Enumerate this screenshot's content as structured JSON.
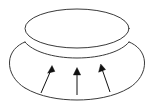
{
  "figure": {
    "kind": "line-diagram",
    "title": "",
    "background_color": "#ffffff",
    "outline_color": "#3a3a3a",
    "arrow_color": "#111111",
    "canvas": {
      "width": 154,
      "height": 103
    },
    "shapes": {
      "dome": {
        "name": "upper-ellipse-dome",
        "center_x": 77,
        "center_y": 28.5,
        "radius_x": 52,
        "radius_y": 19.5
      },
      "skirt_outer": {
        "name": "lower-ellipse-skirt",
        "center_x": 77,
        "center_y": 78,
        "radius_x": 68,
        "radius_y": 20
      },
      "junction_left": {
        "x": 25,
        "y": 42
      },
      "junction_right": {
        "x": 129,
        "y": 42
      }
    },
    "arrows": [
      {
        "name": "arrow-left",
        "label": "",
        "tail": {
          "x": 41,
          "y": 93
        },
        "tip": {
          "x": 52,
          "y": 66
        },
        "direction": "up-right"
      },
      {
        "name": "arrow-middle",
        "label": "",
        "tail": {
          "x": 77,
          "y": 95
        },
        "tip": {
          "x": 77,
          "y": 68
        },
        "direction": "up"
      },
      {
        "name": "arrow-right",
        "label": "",
        "tail": {
          "x": 110,
          "y": 92
        },
        "tip": {
          "x": 101,
          "y": 64
        },
        "direction": "up-left"
      }
    ]
  }
}
